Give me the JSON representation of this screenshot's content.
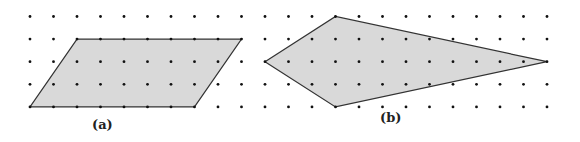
{
  "figure": {
    "grid": {
      "cols": 23,
      "rows": 5,
      "x0": 30,
      "dx": 23.5,
      "y0": 16.5,
      "dy": 22.6,
      "dot_color": "#111111"
    },
    "shapes": [
      {
        "id": "a",
        "name": "parallelogram",
        "label": "(a)",
        "vertices_grid": [
          [
            2,
            1
          ],
          [
            9,
            1
          ],
          [
            7,
            4
          ],
          [
            0,
            4
          ]
        ],
        "fill": "#d9d9d9",
        "stroke": "#333333",
        "label_pos": [
          92,
          117
        ]
      },
      {
        "id": "b",
        "name": "kite",
        "label": "(b)",
        "vertices_grid": [
          [
            10,
            2
          ],
          [
            13,
            0
          ],
          [
            22,
            2
          ],
          [
            13,
            4
          ]
        ],
        "fill": "#d9d9d9",
        "stroke": "#333333",
        "label_pos": [
          380,
          110
        ]
      }
    ]
  }
}
